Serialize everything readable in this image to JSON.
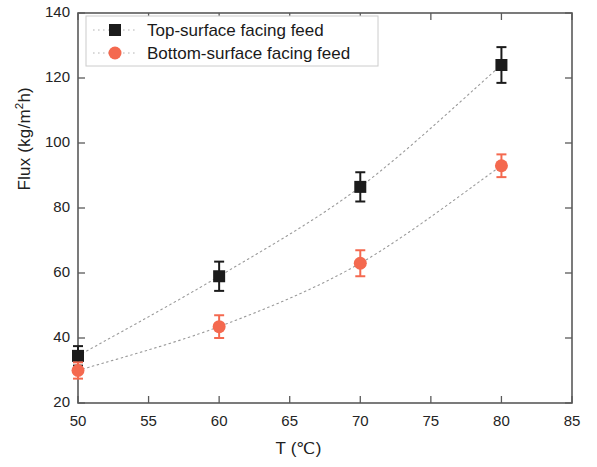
{
  "chart_data": {
    "type": "scatter",
    "title": "",
    "xlabel": "T (℃)",
    "ylabel": "Flux (kg/m²h)",
    "ylabel_parts": {
      "pre": "Flux (kg/m",
      "sup": "2",
      "post": "h)"
    },
    "xlim": [
      50,
      85
    ],
    "ylim": [
      20,
      140
    ],
    "xticks": [
      50,
      55,
      60,
      65,
      70,
      75,
      80,
      85
    ],
    "yticks": [
      20,
      40,
      60,
      80,
      100,
      120,
      140
    ],
    "grid": false,
    "legend_position": "top-left",
    "x": [
      50,
      60,
      70,
      80
    ],
    "series": [
      {
        "name": "Top-surface facing feed",
        "marker": "square",
        "color": "#1b1b1b",
        "values": [
          34.5,
          59.0,
          86.5,
          124.0
        ],
        "errors": [
          3.0,
          4.5,
          4.5,
          5.5
        ]
      },
      {
        "name": "Bottom-surface facing feed",
        "marker": "circle",
        "color": "#f4694f",
        "values": [
          30.0,
          43.5,
          63.0,
          93.0
        ],
        "errors": [
          2.5,
          3.5,
          4.0,
          3.5
        ]
      }
    ]
  },
  "legend": {
    "items": [
      {
        "label": "Top-surface facing feed",
        "marker": "square",
        "color": "#1b1b1b"
      },
      {
        "label": "Bottom-surface facing feed",
        "marker": "circle",
        "color": "#f4694f"
      }
    ]
  },
  "axis": {
    "x_tick_labels": [
      "50",
      "55",
      "60",
      "65",
      "70",
      "75",
      "80",
      "85"
    ],
    "y_tick_labels": [
      "20",
      "40",
      "60",
      "80",
      "100",
      "120",
      "140"
    ]
  }
}
